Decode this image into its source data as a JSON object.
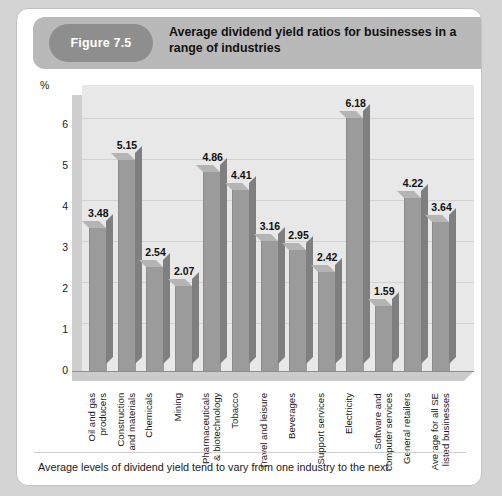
{
  "figure": {
    "badge_label": "Figure 7.5",
    "title": "Average dividend yield ratios for businesses in a range of industries",
    "caption": "Average levels of dividend yield tend to vary from one industry to the next.",
    "badge_color": "#8e8e8e",
    "header_color": "#b9b9b9",
    "bar_color": "#9b9b9b",
    "bar_side_color": "#7f7f7f",
    "bar_top_color": "#b4b4b4",
    "panel_color": "#e8e8e8"
  },
  "chart_data": {
    "type": "bar",
    "title": "Average dividend yield ratios for businesses in a range of industries",
    "xlabel": "",
    "ylabel": "%",
    "ylim": [
      0,
      6.6
    ],
    "yticks": [
      0,
      1,
      2,
      3,
      4,
      5,
      6
    ],
    "ytick_labels": [
      "0",
      "1",
      "2",
      "3",
      "4",
      "5",
      "6"
    ],
    "grid": true,
    "legend": false,
    "data_labels": true,
    "categories": [
      "Oil and gas\nproducers",
      "Construction\nand materials",
      "Chemicals",
      "Mining",
      "Pharmaceuticals\n& biotechnology",
      "Tobacco",
      "Travel and leisure",
      "Beverages",
      "Support services",
      "Electricity",
      "Software and\ncomputer services",
      "General retailers",
      "Average for all SE\nlisted businesses"
    ],
    "values": [
      3.48,
      5.15,
      2.54,
      2.07,
      4.86,
      4.41,
      3.16,
      2.95,
      2.42,
      6.18,
      1.59,
      4.22,
      3.64
    ],
    "value_labels": [
      "3.48",
      "5.15",
      "2.54",
      "2.07",
      "4.86",
      "4.41",
      "3.16",
      "2.95",
      "2.42",
      "6.18",
      "1.59",
      "4.22",
      "3.64"
    ]
  }
}
